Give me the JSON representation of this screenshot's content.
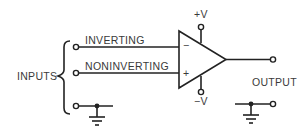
{
  "diagram": {
    "type": "op-amp schematic",
    "labels": {
      "inputs": "INPUTS",
      "inverting": "INVERTING",
      "noninverting": "NONINVERTING",
      "output": "OUTPUT",
      "pos_supply": "+V",
      "neg_supply": "−V",
      "minus_sign": "−",
      "plus_sign": "+"
    },
    "colors": {
      "line": "#222222",
      "text": "#3a3a3a",
      "background": "#ffffff"
    }
  }
}
